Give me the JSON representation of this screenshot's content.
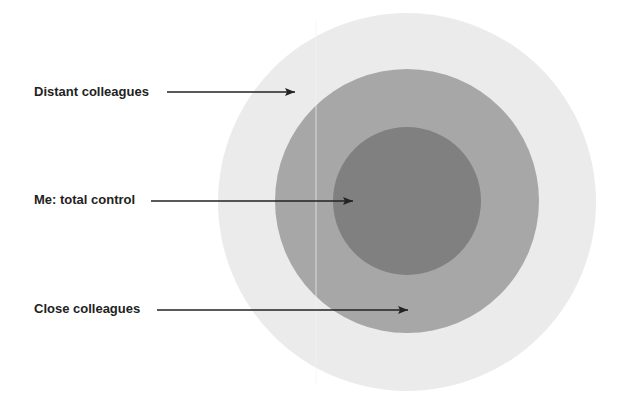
{
  "diagram": {
    "rings": [
      {
        "name": "distant-colleagues",
        "color": "#ebebeb",
        "cx": 407,
        "cy": 202,
        "r": 189
      },
      {
        "name": "close-colleagues",
        "color": "#a7a7a7",
        "cx": 407,
        "cy": 201,
        "r": 132
      },
      {
        "name": "me",
        "color": "#808080",
        "cx": 407,
        "cy": 201,
        "r": 74
      }
    ],
    "labels": [
      {
        "text": "Distant colleagues",
        "x": 34,
        "y": 84,
        "arrow": {
          "x1": 167,
          "y1": 92,
          "x2": 295,
          "y2": 92
        }
      },
      {
        "text": "Me: total control",
        "x": 34,
        "y": 192,
        "arrow": {
          "x1": 151,
          "y1": 201,
          "x2": 353,
          "y2": 201
        }
      },
      {
        "text": "Close colleagues",
        "x": 34,
        "y": 301,
        "arrow": {
          "x1": 157,
          "y1": 310,
          "x2": 408,
          "y2": 310
        }
      }
    ],
    "arrow_color": "#222222"
  }
}
